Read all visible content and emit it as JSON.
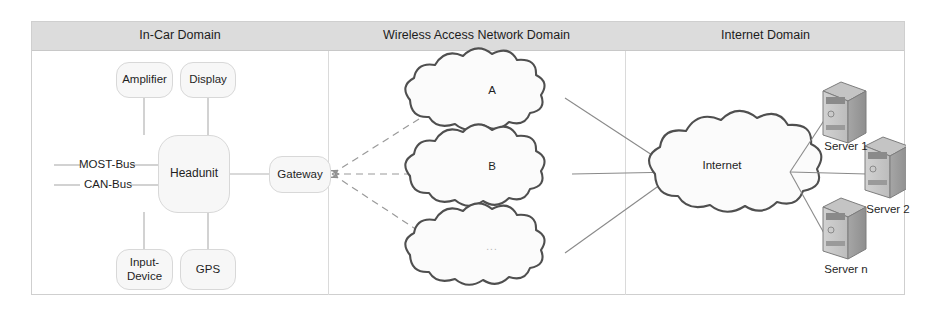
{
  "figure": {
    "domains": [
      {
        "id": "in-car",
        "title": "In-Car Domain"
      },
      {
        "id": "wireless",
        "title": "Wireless Access Network Domain"
      },
      {
        "id": "internet",
        "title": "Internet Domain"
      }
    ],
    "in_car": {
      "nodes": [
        {
          "id": "amplifier",
          "label": "Amplifier"
        },
        {
          "id": "display",
          "label": "Display"
        },
        {
          "id": "headunit",
          "label": "Headunit"
        },
        {
          "id": "gateway",
          "label": "Gateway"
        },
        {
          "id": "input-device",
          "label": "Input-\nDevice"
        },
        {
          "id": "gps",
          "label": "GPS"
        }
      ],
      "buses": [
        {
          "id": "most-bus",
          "label": "MOST-Bus"
        },
        {
          "id": "can-bus",
          "label": "CAN-Bus"
        }
      ]
    },
    "wireless": {
      "clouds": [
        {
          "id": "cloud-a",
          "label": "A",
          "faint": false
        },
        {
          "id": "cloud-b",
          "label": "B",
          "faint": false
        },
        {
          "id": "cloud-ellipsis",
          "label": "...",
          "faint": true
        }
      ]
    },
    "internet": {
      "cloud": {
        "id": "internet-cloud",
        "label": "Internet"
      },
      "servers": [
        {
          "id": "server-1",
          "label": "Server 1"
        },
        {
          "id": "server-2",
          "label": "Server 2"
        },
        {
          "id": "server-n",
          "label": "Server n"
        }
      ]
    },
    "colors": {
      "header_band": "#dcdcdc",
      "node_fill": "#f7f7f7",
      "node_stroke": "#d8d8d8",
      "cloud_stroke": "#555555",
      "link": "#9a9a9a",
      "server_body": "#9c9c9c",
      "text": "#1c1c1c"
    }
  }
}
